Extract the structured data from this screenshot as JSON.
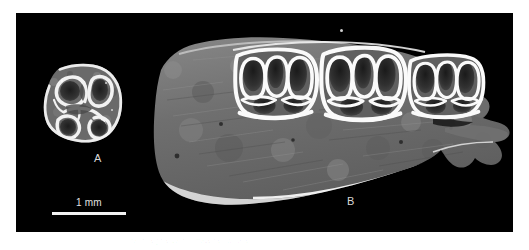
{
  "figure": {
    "domain": "micro-ct-specimen-photograph",
    "background_color": "#ffffff",
    "panel_background_color": "#000000",
    "panel": {
      "x": 16,
      "y": 13,
      "width": 497,
      "height": 219
    }
  },
  "labels": {
    "panel_a": "A",
    "panel_b": "B",
    "label_color": "#d8d8d8"
  },
  "scalebar": {
    "text": "1 mm",
    "bar_color": "#f2f2f2",
    "text_color": "#e2e2e2",
    "length_px": 74
  },
  "specimens": {
    "a": {
      "name": "isolated-molar-occlusal",
      "description": "Isolated molar tooth, occlusal (crown) view showing enamel lophs enclosing darker dentine basins",
      "enamel_color": "#f4f4f4",
      "dentine_color": "#3a3a3a",
      "matrix_color": "#6a6a6a"
    },
    "b": {
      "name": "mandible-with-tooth-row",
      "description": "Partial mandible in lateral/sectioned view with three cheek teeth preserved in the tooth row and a posterior bony process",
      "bone_color": "#787878",
      "enamel_color": "#fafafa",
      "dentine_color": "#2e2e2e",
      "tooth_count": 3
    }
  },
  "artifacts": {
    "dust_speck": "small bright speck above the tooth row",
    "caption_trace": "faint illegible caption trace below panel"
  }
}
